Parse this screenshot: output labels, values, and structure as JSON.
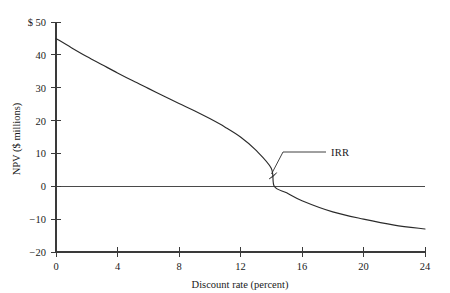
{
  "chart_data": {
    "type": "line",
    "title": "",
    "subtitle": "",
    "xlabel": "Discount rate (percent)",
    "ylabel": "NPV ($ millions)",
    "xlim": [
      0,
      24
    ],
    "ylim": [
      -20,
      50
    ],
    "grid": false,
    "legend": "none",
    "x_ticks": [
      0,
      4,
      8,
      12,
      16,
      20,
      24
    ],
    "x_tick_labels": [
      "0",
      "4",
      "8",
      "12",
      "16",
      "20",
      "24"
    ],
    "y_ticks": [
      -20,
      -10,
      0,
      10,
      20,
      30,
      40,
      50
    ],
    "y_tick_labels": [
      "−20",
      "−10",
      "0",
      "10",
      "20",
      "30",
      "40",
      "$ 50"
    ],
    "series": [
      {
        "name": "NPV profile",
        "color": "#2b2b2b",
        "x": [
          0,
          2,
          4,
          6,
          8,
          10,
          12,
          14,
          16,
          18,
          20,
          22,
          24
        ],
        "values": [
          45.0,
          39.6,
          34.5,
          29.8,
          25.3,
          21.0,
          17.0,
          13.2,
          9.5,
          6.1,
          2.8,
          -0.3,
          -13.0
        ]
      },
      {
        "name": "Zero reference line",
        "color": "#4a4a4a",
        "x": [
          0,
          24
        ],
        "values": [
          0,
          0
        ]
      }
    ],
    "curve_points": [
      {
        "x": 0,
        "y": 45.0
      },
      {
        "x": 1,
        "y": 42.2
      },
      {
        "x": 2,
        "y": 39.5
      },
      {
        "x": 3,
        "y": 37.0
      },
      {
        "x": 4,
        "y": 34.5
      },
      {
        "x": 5,
        "y": 32.1
      },
      {
        "x": 6,
        "y": 29.8
      },
      {
        "x": 7,
        "y": 27.5
      },
      {
        "x": 8,
        "y": 25.2
      },
      {
        "x": 9,
        "y": 23.0
      },
      {
        "x": 10,
        "y": 20.6
      },
      {
        "x": 11,
        "y": 18.0
      },
      {
        "x": 12,
        "y": 15.0
      },
      {
        "x": 13,
        "y": 11.0
      },
      {
        "x": 14,
        "y": 5.5
      },
      {
        "x": 14.2,
        "y": 0.0
      },
      {
        "x": 15,
        "y": -2.0
      },
      {
        "x": 16,
        "y": -4.4
      },
      {
        "x": 18,
        "y": -7.8
      },
      {
        "x": 20,
        "y": -10.0
      },
      {
        "x": 22,
        "y": -11.8
      },
      {
        "x": 24,
        "y": -13.0
      }
    ],
    "annotations": [
      {
        "label": "IRR",
        "target_x": 14.0,
        "target_y": 0.0,
        "description": "Internal rate of return, where the NPV curve crosses zero"
      }
    ]
  },
  "axis": {
    "y_axis_title": "NPV ($ millions)",
    "x_axis_title": "Discount rate (percent)"
  },
  "ticks": {
    "y": [
      {
        "label": "$ 50",
        "value": 50
      },
      {
        "label": "40",
        "value": 40
      },
      {
        "label": "30",
        "value": 30
      },
      {
        "label": "20",
        "value": 20
      },
      {
        "label": "10",
        "value": 10
      },
      {
        "label": "0",
        "value": 0
      },
      {
        "label": "−10",
        "value": -10
      },
      {
        "label": "−20",
        "value": -20
      }
    ],
    "x": [
      {
        "label": "0",
        "value": 0
      },
      {
        "label": "4",
        "value": 4
      },
      {
        "label": "8",
        "value": 8
      },
      {
        "label": "12",
        "value": 12
      },
      {
        "label": "16",
        "value": 16
      },
      {
        "label": "20",
        "value": 20
      },
      {
        "label": "24",
        "value": 24
      }
    ]
  },
  "annotation": {
    "irr_label": "IRR"
  },
  "colors": {
    "background": "#ffffff",
    "axis": "#3a3a3a",
    "curve": "#2b2b2b",
    "zero_line": "#4a4a4a",
    "text": "#1a1a1a"
  }
}
